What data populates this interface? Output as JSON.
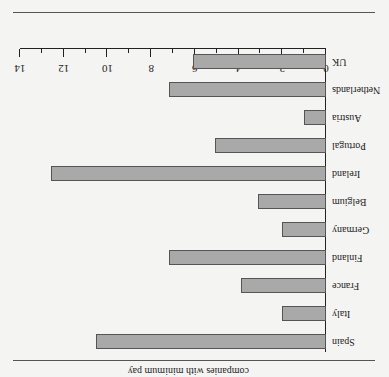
{
  "chart_data": {
    "type": "bar",
    "orientation": "horizontal",
    "rotated_180": true,
    "title": "",
    "caption_partial": "companies with minimum pay",
    "xlabel": "",
    "ylabel": "",
    "xlim": [
      0,
      14
    ],
    "xticks": [
      0,
      2,
      4,
      6,
      8,
      10,
      12,
      14
    ],
    "grid": false,
    "categories": [
      "UK",
      "Netherlands",
      "Austria",
      "Portugal",
      "Ireland",
      "Belgium",
      "Germany",
      "Finland",
      "France",
      "Italy",
      "Spain"
    ],
    "values": [
      6.1,
      7.2,
      1.0,
      5.1,
      12.6,
      3.1,
      2.0,
      7.2,
      3.9,
      2.0,
      10.5
    ],
    "bar_color": "#a9a9a9"
  }
}
